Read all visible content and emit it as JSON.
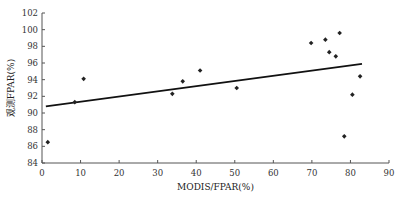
{
  "chart_data": {
    "type": "scatter",
    "title": "",
    "xlabel": "MODIS/FPAR(%)",
    "ylabel": "观测FPAR(%)",
    "xlim": [
      0,
      90
    ],
    "ylim": [
      84,
      102
    ],
    "xticks": [
      0,
      10,
      20,
      30,
      40,
      50,
      60,
      70,
      80,
      90
    ],
    "yticks": [
      84,
      86,
      88,
      90,
      92,
      94,
      96,
      98,
      100,
      102
    ],
    "grid": false,
    "legend": null,
    "points": [
      [
        1.5,
        86.5
      ],
      [
        8.5,
        91.3
      ],
      [
        10.8,
        94.1
      ],
      [
        33.8,
        92.3
      ],
      [
        36.5,
        93.8
      ],
      [
        41,
        95.1
      ],
      [
        50.5,
        93
      ],
      [
        69.8,
        98.4
      ],
      [
        73.5,
        98.8
      ],
      [
        74.5,
        97.3
      ],
      [
        76.2,
        96.8
      ],
      [
        77.2,
        99.6
      ],
      [
        78.4,
        87.2
      ],
      [
        80.5,
        92.2
      ],
      [
        82.5,
        94.4
      ]
    ],
    "trendline": {
      "x": [
        1,
        83
      ],
      "y": [
        90.8,
        95.9
      ]
    }
  }
}
